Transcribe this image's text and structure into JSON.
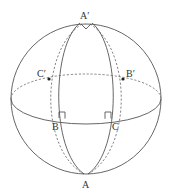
{
  "diagram": {
    "type": "sphere-spherical-triangles",
    "labels": {
      "top": "A′",
      "bottom": "A",
      "front_left": "B",
      "front_right": "C",
      "back_left": "C′",
      "back_right": "B′"
    },
    "colors": {
      "stroke": "#555555",
      "background": "#ffffff"
    }
  }
}
